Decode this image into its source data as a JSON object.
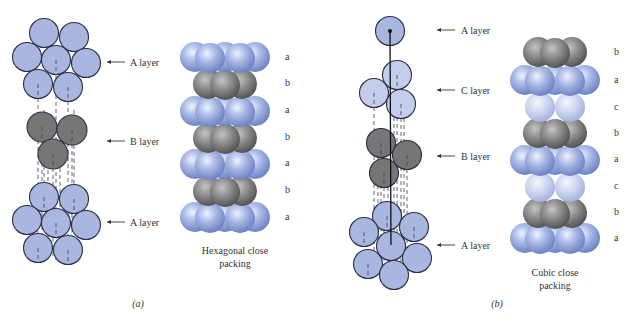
{
  "figure": {
    "panels": [
      {
        "id": "a",
        "sublabel": "(a)",
        "sublabel_pos": [
          138,
          307
        ],
        "caption_lines": [
          "Hexagonal close",
          "packing"
        ],
        "caption_x": 235,
        "caption_y": 254,
        "layer_labels": [
          {
            "text": "A layer",
            "arrow_y": 62,
            "x1": 107,
            "x2": 125,
            "tx": 130
          },
          {
            "text": "B layer",
            "arrow_y": 141,
            "x1": 107,
            "x2": 125,
            "tx": 130
          },
          {
            "text": "A layer",
            "arrow_y": 222,
            "x1": 107,
            "x2": 125,
            "tx": 130
          }
        ],
        "stack_labels": {
          "x": 285,
          "items": [
            {
              "text": "a",
              "y": 60
            },
            {
              "text": "b",
              "y": 86
            },
            {
              "text": "a",
              "y": 113
            },
            {
              "text": "b",
              "y": 140
            },
            {
              "text": "a",
              "y": 166
            },
            {
              "text": "b",
              "y": 193
            },
            {
              "text": "a",
              "y": 220
            }
          ]
        },
        "stack_rows": [
          {
            "type": "a",
            "y": 57
          },
          {
            "type": "b",
            "y": 84
          },
          {
            "type": "a",
            "y": 111
          },
          {
            "type": "b",
            "y": 138
          },
          {
            "type": "a",
            "y": 164
          },
          {
            "type": "b",
            "y": 191
          },
          {
            "type": "a",
            "y": 217
          }
        ],
        "stack_center_x": 225
      },
      {
        "id": "b",
        "sublabel": "(b)",
        "sublabel_pos": [
          497,
          307
        ],
        "caption_lines": [
          "Cubic close",
          "packing"
        ],
        "caption_x": 555,
        "caption_y": 276,
        "layer_labels": [
          {
            "text": "A layer",
            "arrow_y": 30,
            "x1": 437,
            "x2": 455,
            "tx": 461
          },
          {
            "text": "C layer",
            "arrow_y": 90,
            "x1": 437,
            "x2": 455,
            "tx": 461
          },
          {
            "text": "B layer",
            "arrow_y": 156,
            "x1": 437,
            "x2": 455,
            "tx": 461
          },
          {
            "text": "A layer",
            "arrow_y": 245,
            "x1": 437,
            "x2": 455,
            "tx": 461
          }
        ],
        "stack_labels": {
          "x": 614,
          "items": [
            {
              "text": "b",
              "y": 55
            },
            {
              "text": "a",
              "y": 83
            },
            {
              "text": "c",
              "y": 110
            },
            {
              "text": "b",
              "y": 136
            },
            {
              "text": "a",
              "y": 162
            },
            {
              "text": "c",
              "y": 189
            },
            {
              "text": "b",
              "y": 215
            },
            {
              "text": "a",
              "y": 241
            }
          ]
        },
        "stack_rows": [
          {
            "type": "b",
            "y": 52
          },
          {
            "type": "a",
            "y": 80
          },
          {
            "type": "c",
            "y": 107
          },
          {
            "type": "b",
            "y": 133
          },
          {
            "type": "a",
            "y": 160
          },
          {
            "type": "c",
            "y": 187
          },
          {
            "type": "b",
            "y": 213
          },
          {
            "type": "a",
            "y": 238
          }
        ],
        "stack_center_x": 555
      }
    ],
    "flat_layers": {
      "a_top": [
        [
          44,
          33
        ],
        [
          74,
          37
        ],
        [
          27,
          57
        ],
        [
          56,
          60
        ],
        [
          86,
          63
        ],
        [
          38,
          84
        ],
        [
          68,
          87
        ]
      ],
      "a_b": [
        [
          42,
          127
        ],
        [
          72,
          130
        ],
        [
          53,
          154
        ]
      ],
      "a_bottom": [
        [
          44,
          197
        ],
        [
          74,
          199
        ],
        [
          27,
          220
        ],
        [
          56,
          223
        ],
        [
          86,
          225
        ],
        [
          38,
          248
        ],
        [
          68,
          250
        ]
      ],
      "b_top_A": [
        [
          390,
          31
        ]
      ],
      "b_C": [
        [
          397,
          75
        ],
        [
          374,
          93
        ],
        [
          401,
          104
        ]
      ],
      "b_B": [
        [
          381,
          143
        ],
        [
          407,
          155
        ],
        [
          384,
          173
        ]
      ],
      "b_bottom_A": [
        [
          387,
          216
        ],
        [
          414,
          227
        ],
        [
          364,
          232
        ],
        [
          391,
          246
        ],
        [
          417,
          258
        ],
        [
          368,
          264
        ],
        [
          394,
          275
        ]
      ]
    },
    "colors": {
      "flat_blue": "#a8b6e0",
      "flat_light": "#c4cdec",
      "flat_dark": "#767676",
      "stroke": "#2b3046",
      "sphere_blue_hi": "#e3e9fb",
      "sphere_blue_lo": "#7a8fcc",
      "sphere_gray_hi": "#b9b9b9",
      "sphere_gray_lo": "#5c5c5c",
      "sphere_pale_hi": "#eef1fb",
      "sphere_pale_lo": "#a7b6df"
    }
  }
}
